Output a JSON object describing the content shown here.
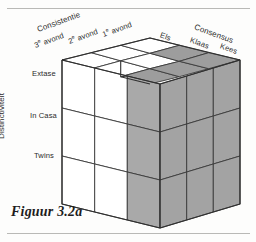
{
  "figure": {
    "caption": "Figuur 3.2a",
    "axes": {
      "left_axis_title": "Distinctiviteit",
      "top_left_axis_title": "Consistentie",
      "top_right_axis_title": "Consensus"
    },
    "left_labels": [
      "Extase",
      "In Casa",
      "Twins"
    ],
    "consistentie_labels": [
      "3e avond",
      "2e avond",
      "1e avond"
    ],
    "consistentie_labels_parts": [
      {
        "num": "3",
        "sup": "e",
        "rest": " avond"
      },
      {
        "num": "2",
        "sup": "e",
        "rest": " avond"
      },
      {
        "num": "1",
        "sup": "e",
        "rest": " avond"
      }
    ],
    "consensus_labels": [
      "Els",
      "Klaas",
      "Kees"
    ]
  },
  "colors": {
    "shaded_cell": "#a9a9a9",
    "shaded_cell_top": "#9d9d9d",
    "shaded_cell_side": "#a3a3a3",
    "white_cell": "#ffffff",
    "outline": "#3a3a3a",
    "rule": "#b9b9b6",
    "text": "#2b2b2b"
  },
  "cube": {
    "grid": "3x3x3",
    "front_face_shaded_columns": [
      3
    ],
    "right_face_shaded": "all",
    "top_face_shaded_cells": [
      "row3-col2",
      "row3-col3",
      "row2-col3",
      "row1-col3"
    ]
  }
}
